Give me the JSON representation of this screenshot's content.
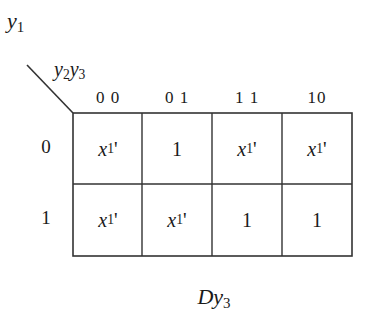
{
  "diagram": {
    "type": "karnaugh-map",
    "row_variable": {
      "base": "y",
      "sub": "1"
    },
    "col_variables": [
      {
        "base": "y",
        "sub": "2"
      },
      {
        "base": "y",
        "sub": "3"
      }
    ],
    "column_headers": [
      "0 0",
      "0 1",
      "1 1",
      "10"
    ],
    "row_headers": [
      "0",
      "1"
    ],
    "cells": [
      [
        {
          "base": "x",
          "sub": "1",
          "prime": "'"
        },
        {
          "text": "1"
        },
        {
          "base": "x",
          "sub": "1",
          "prime": "'"
        },
        {
          "base": "x",
          "sub": "1",
          "prime": "'"
        }
      ],
      [
        {
          "base": "x",
          "sub": "1",
          "prime": "'"
        },
        {
          "base": "x",
          "sub": "1",
          "prime": "'"
        },
        {
          "text": "1"
        },
        {
          "text": "1"
        }
      ]
    ],
    "caption": {
      "base": "Dy",
      "sub": "3"
    },
    "line_color": "#333333"
  }
}
